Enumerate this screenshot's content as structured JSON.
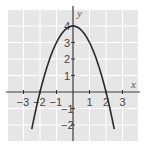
{
  "chart_data": {
    "type": "line",
    "title": "",
    "xlabel": "x",
    "ylabel": "y",
    "function": "y = 4 - x^2",
    "xlim": [
      -4,
      4
    ],
    "ylim": [
      -3,
      5
    ],
    "grid": true,
    "x_ticks": [
      "-3",
      "-2",
      "-1",
      "1",
      "2",
      "3"
    ],
    "y_ticks": [
      "4",
      "3",
      "2",
      "1",
      "-1",
      "-2"
    ],
    "series": [
      {
        "name": "parabola",
        "x": [
          -2.5,
          -2,
          -1.5,
          -1,
          -0.5,
          0,
          0.5,
          1,
          1.5,
          2,
          2.5
        ],
        "y": [
          -2.25,
          0,
          1.75,
          3,
          3.75,
          4,
          3.75,
          3,
          1.75,
          0,
          -2.25
        ]
      }
    ],
    "colors": {
      "grid_bg": "#e6e6e6",
      "grid_line": "#ffffff",
      "curve": "#2a2a2a",
      "axis": "#333333"
    }
  }
}
